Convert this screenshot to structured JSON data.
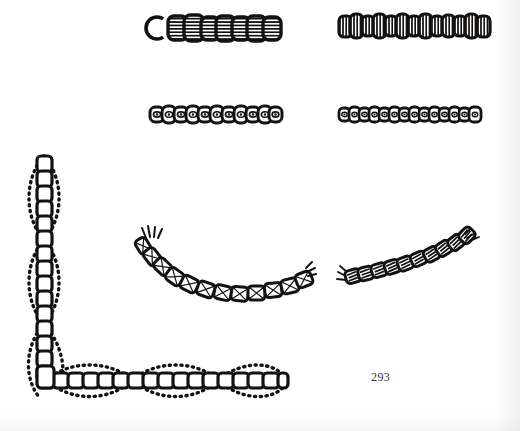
{
  "page": {
    "number": "293",
    "background_color": "#ffffff",
    "ink_color": "#141210",
    "width": 520,
    "height": 431,
    "media": "scanned-book-plate"
  },
  "figures": [
    {
      "id": "fig-top-left",
      "name": "barrel-link-chain-horizontal",
      "description": "Horizontal chain of wide barrel links with horizontal inner striping; leftmost link is a plain open ring.",
      "orientation": "horizontal",
      "link_count": 9,
      "first_link_style": "open-ring",
      "link_fill": "horizontal-stripes",
      "x": 143,
      "y": 12,
      "width": 140,
      "height": 30
    },
    {
      "id": "fig-top-right",
      "name": "narrow-link-chain-horizontal",
      "description": "Horizontal chain of narrow oval links filled with fine vertical striping.",
      "orientation": "horizontal",
      "link_count": 13,
      "first_link_style": "striped",
      "link_fill": "vertical-stripes",
      "x": 339,
      "y": 12,
      "width": 155,
      "height": 28
    },
    {
      "id": "fig-mid-left",
      "name": "eye-link-chain-horizontal-short",
      "description": "Horizontal chain of small rounded links, each containing a single small eye/dot motif.",
      "orientation": "horizontal",
      "link_count": 11,
      "link_fill": "single-eye",
      "x": 150,
      "y": 104,
      "width": 128,
      "height": 24
    },
    {
      "id": "fig-mid-right",
      "name": "eye-link-chain-horizontal-long",
      "description": "Horizontal chain of small square-rounded links, each with a tiny eye motif, denser spacing.",
      "orientation": "horizontal",
      "link_count": 14,
      "link_fill": "single-eye",
      "x": 339,
      "y": 105,
      "width": 140,
      "height": 22
    },
    {
      "id": "fig-corner",
      "name": "corner-border-chain",
      "description": "Right-angle corner border: a vertical ladder chain and a horizontal ladder chain, each flanked by beaded chains that bow outward forming repeated lens/eye shapes.",
      "orientation": "corner",
      "vertical_lens_count": 3,
      "horizontal_lens_count": 3,
      "core_link_style": "square-ladder",
      "flanking_style": "beaded-curve",
      "x": 20,
      "y": 152,
      "width": 260,
      "height": 248
    },
    {
      "id": "fig-arc-left",
      "name": "crossed-link-chain-arc-left",
      "description": "Shallow U-shaped arc of barrel links with crossed diagonal threads inside; frayed thread ends at both tips.",
      "orientation": "arc",
      "link_count": 12,
      "link_fill": "crossed-threads",
      "end_style": "frayed-threads",
      "x": 138,
      "y": 226,
      "width": 172,
      "height": 76
    },
    {
      "id": "fig-arc-right",
      "name": "banded-link-chain-arc-right",
      "description": "Upward-sweeping arc of rounded links each with a bold zig-zag / banded inner marking; frayed thread ends at both tips.",
      "orientation": "arc",
      "link_count": 14,
      "link_fill": "zigzag-bands",
      "end_style": "frayed-threads",
      "x": 340,
      "y": 238,
      "width": 168,
      "height": 66
    }
  ]
}
